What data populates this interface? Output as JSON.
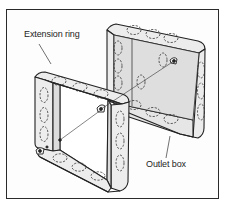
{
  "figure": {
    "type": "technical-illustration",
    "labels": {
      "extension_ring": "Extension ring",
      "outlet_box": "Outlet box"
    },
    "colors": {
      "line": "#222222",
      "fill": "#ebebeb",
      "inner_fill": "#dcdcdc",
      "background": "#ffffff"
    }
  }
}
